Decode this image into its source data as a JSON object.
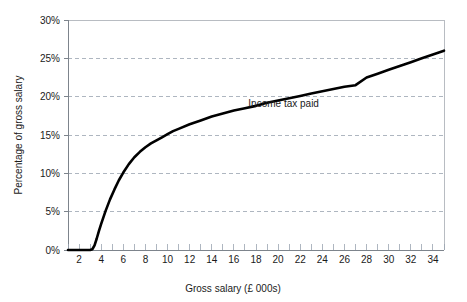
{
  "chart_data": {
    "type": "line",
    "title": "",
    "subtitle": "",
    "xlabel": "Gross salary (£ 000s)",
    "ylabel": "Percentage of gross salary",
    "xlim": [
      1,
      35
    ],
    "ylim": [
      0,
      30
    ],
    "grid": true,
    "grid_axis": "y",
    "grid_style": "dashed",
    "legend": false,
    "legend_position": "none",
    "annotations": [
      {
        "text": "Income tax paid",
        "x": 20.5,
        "y": 18.6
      }
    ],
    "xticks": [
      2,
      4,
      6,
      8,
      10,
      12,
      14,
      16,
      18,
      20,
      22,
      24,
      26,
      28,
      30,
      32,
      34
    ],
    "xtick_labels": [
      "2",
      "4",
      "6",
      "8",
      "10",
      "12",
      "14",
      "16",
      "18",
      "20",
      "22",
      "24",
      "26",
      "28",
      "30",
      "32",
      "34"
    ],
    "xminor_step": 1,
    "yticks": [
      0,
      5,
      10,
      15,
      20,
      25,
      30
    ],
    "ytick_labels": [
      "0%",
      "5%",
      "10%",
      "15%",
      "20%",
      "25%",
      "30%"
    ],
    "series": [
      {
        "name": "Income tax paid",
        "color": "#000000",
        "x": [
          1,
          1.5,
          2,
          2.5,
          3,
          3.2,
          3.4,
          3.6,
          3.8,
          4,
          4.4,
          4.8,
          5.2,
          5.6,
          6,
          6.5,
          7,
          7.5,
          8,
          8.5,
          9,
          9.5,
          10,
          10.5,
          11,
          12,
          13,
          14,
          15,
          16,
          17,
          18,
          19,
          20,
          21,
          22,
          23,
          24,
          25,
          26,
          27,
          28,
          29,
          30,
          31,
          32,
          33,
          34,
          35
        ],
        "y": [
          0,
          0,
          0,
          0,
          0,
          0.1,
          0.6,
          1.5,
          2.5,
          3.4,
          5.1,
          6.6,
          7.9,
          9.1,
          10.1,
          11.2,
          12.1,
          12.8,
          13.4,
          13.9,
          14.3,
          14.7,
          15.1,
          15.5,
          15.8,
          16.4,
          16.9,
          17.4,
          17.8,
          18.2,
          18.5,
          18.8,
          19.2,
          19.5,
          19.8,
          20.1,
          20.4,
          20.7,
          21.0,
          21.3,
          21.5,
          22.5,
          23.0,
          23.5,
          24.0,
          24.5,
          25.0,
          25.5,
          26.0
        ]
      }
    ]
  },
  "axes": {
    "y_axis_title": "Percentage of gross salary",
    "x_axis_title": "Gross salary (£ 000s)"
  },
  "colors": {
    "series_line": "#000000",
    "gridline": "#9aa4b0",
    "frame": "#b8bcc2",
    "text": "#1a1a1a",
    "background": "#ffffff"
  }
}
